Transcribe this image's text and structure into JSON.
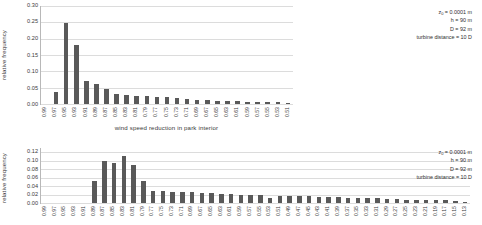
{
  "chart_data": [
    {
      "type": "bar",
      "id": "wind-speed-reduction",
      "title": "",
      "xlabel": "wind speed reduction in park interior",
      "ylabel": "relative frequency",
      "ylim": [
        0.0,
        0.3
      ],
      "yticks": [
        0.3,
        0.25,
        0.2,
        0.15,
        0.1,
        0.05,
        0.0
      ],
      "ytick_labels": [
        "0.30",
        "0.25",
        "0.20",
        "0.15",
        "0.10",
        "0.05",
        "0.00"
      ],
      "grid": true,
      "legend": "none",
      "bar_color": "#595959",
      "categories": [
        "0.99",
        "0.97",
        "0.95",
        "0.93",
        "0.91",
        "0.89",
        "0.87",
        "0.85",
        "0.83",
        "0.81",
        "0.79",
        "0.77",
        "0.75",
        "0.73",
        "0.71",
        "0.69",
        "0.67",
        "0.65",
        "0.63",
        "0.61",
        "0.59",
        "0.57",
        "0.55",
        "0.53",
        "0.51"
      ],
      "values": [
        0.0,
        0.036,
        0.249,
        0.181,
        0.07,
        0.062,
        0.045,
        0.03,
        0.027,
        0.024,
        0.024,
        0.023,
        0.021,
        0.017,
        0.015,
        0.013,
        0.011,
        0.01,
        0.009,
        0.008,
        0.007,
        0.006,
        0.005,
        0.005,
        0.004
      ],
      "annotation": {
        "roughness": "z₀ = 0.0001 m",
        "hub_height": "h = 90 m",
        "diameter": "D = 92 m",
        "spacing": "turbine distance = 10 D"
      }
    },
    {
      "type": "bar",
      "id": "power-efficiency",
      "title": "",
      "xlabel": "power efficiency in park interior",
      "ylabel": "relative frequency",
      "ylim": [
        0.0,
        0.13
      ],
      "yticks": [
        0.12,
        0.1,
        0.08,
        0.06,
        0.04,
        0.02,
        0.0
      ],
      "ytick_labels": [
        "0.12",
        "0.10",
        "0.08",
        "0.06",
        "0.04",
        "0.02",
        "0.00"
      ],
      "grid": true,
      "legend": "none",
      "bar_color": "#595959",
      "categories": [
        "0.99",
        "0.97",
        "0.95",
        "0.93",
        "0.91",
        "0.89",
        "0.87",
        "0.85",
        "0.83",
        "0.81",
        "0.79",
        "0.77",
        "0.75",
        "0.73",
        "0.71",
        "0.69",
        "0.67",
        "0.65",
        "0.63",
        "0.61",
        "0.59",
        "0.57",
        "0.55",
        "0.53",
        "0.51",
        "0.49",
        "0.47",
        "0.45",
        "0.43",
        "0.41",
        "0.39",
        "0.37",
        "0.35",
        "0.33",
        "0.31",
        "0.29",
        "0.27",
        "0.25",
        "0.23",
        "0.21",
        "0.19",
        "0.17",
        "0.15",
        "0.13"
      ],
      "values": [
        0.0,
        0.0,
        0.0,
        0.0,
        0.0,
        0.053,
        0.1,
        0.094,
        0.11,
        0.09,
        0.053,
        0.029,
        0.028,
        0.027,
        0.026,
        0.025,
        0.024,
        0.023,
        0.022,
        0.021,
        0.02,
        0.019,
        0.018,
        0.013,
        0.017,
        0.017,
        0.016,
        0.016,
        0.015,
        0.015,
        0.014,
        0.013,
        0.013,
        0.012,
        0.011,
        0.01,
        0.009,
        0.008,
        0.008,
        0.007,
        0.007,
        0.006,
        0.004,
        0.003
      ],
      "annotation": {
        "roughness": "z₀ = 0.0001 m",
        "hub_height": "h = 90 m",
        "diameter": "D = 92 m",
        "spacing": "turbine distance = 10 D"
      }
    }
  ]
}
